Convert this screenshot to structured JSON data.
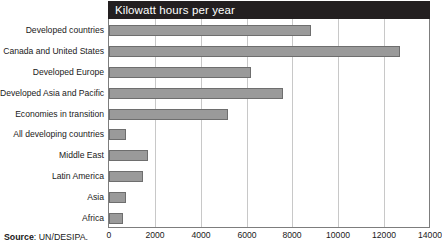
{
  "chart_data": {
    "type": "bar",
    "orientation": "horizontal",
    "title": "Kilowatt hours per year",
    "xlabel": "",
    "ylabel": "",
    "xlim": [
      0,
      14000
    ],
    "xticks": [
      0,
      2000,
      4000,
      6000,
      8000,
      10000,
      12000,
      14000
    ],
    "xtick_labels": [
      "0",
      "2000",
      "4000",
      "6000",
      "8000",
      "10000",
      "12000",
      "14000"
    ],
    "grid": "vertical",
    "legend": "none",
    "bar_color": "#9a9a9a",
    "bar_border_color": "#6e6e6e",
    "title_bar_color": "#231f20",
    "title_text_color": "#ffffff",
    "categories": [
      "Developed countries",
      "Canada and United States",
      "Developed Europe",
      "Developed Asia and Pacific",
      "Economies in transition",
      "All developing countries",
      "Middle East",
      "Latin America",
      "Asia",
      "Africa"
    ],
    "values": [
      8800,
      12700,
      6200,
      7600,
      5200,
      750,
      1700,
      1500,
      750,
      620
    ]
  },
  "source": {
    "label": "Source",
    "separator": ":",
    "value": "UN/DESIPA."
  }
}
